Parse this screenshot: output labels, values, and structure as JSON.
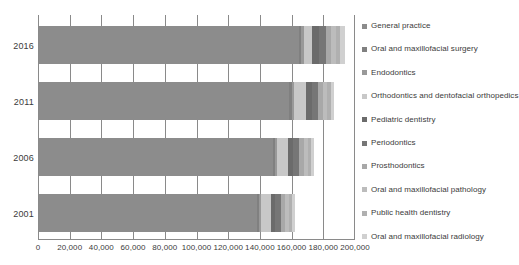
{
  "chart_data": {
    "type": "bar",
    "orientation": "horizontal",
    "stacked": true,
    "title": "",
    "xlabel": "",
    "ylabel": "",
    "xlim": [
      0,
      200000
    ],
    "grid": true,
    "legend_position": "right",
    "categories": [
      "2016",
      "2011",
      "2006",
      "2001"
    ],
    "xticks": [
      0,
      20000,
      40000,
      60000,
      80000,
      100000,
      120000,
      140000,
      160000,
      180000,
      200000
    ],
    "xtick_labels": [
      "0",
      "20,000",
      "40,000",
      "60,000",
      "80,000",
      "100,000",
      "120,000",
      "140,000",
      "160,000",
      "180,000",
      "200,000"
    ],
    "series": [
      {
        "name": "General practice",
        "color": "#8c8c8c",
        "values": [
          164000,
          158000,
          147500,
          137500
        ]
      },
      {
        "name": "Oral and maxillofacial surgery",
        "color": "#808080",
        "values": [
          1500,
          1400,
          1300,
          1200
        ]
      },
      {
        "name": "Endodontics",
        "color": "#999999",
        "values": [
          1700,
          1600,
          1500,
          1300
        ]
      },
      {
        "name": "Orthodontics and dentofacial orthopedics",
        "color": "#c8c8c8",
        "values": [
          5000,
          7500,
          7000,
          6500
        ]
      },
      {
        "name": "Pediatric dentistry",
        "color": "#6b6b6b",
        "values": [
          4500,
          3500,
          3000,
          2600
        ]
      },
      {
        "name": "Periodontics",
        "color": "#767676",
        "values": [
          4300,
          4000,
          3800,
          3500
        ]
      },
      {
        "name": "Prosthodontics",
        "color": "#a8a8a8",
        "values": [
          3200,
          3000,
          2900,
          2800
        ]
      },
      {
        "name": "Oral and maxillofacial pathology",
        "color": "#bcbcbc",
        "values": [
          3000,
          2800,
          2600,
          2400
        ]
      },
      {
        "name": "Public health dentistry",
        "color": "#b0b0b0",
        "values": [
          2800,
          2200,
          2000,
          1900
        ]
      },
      {
        "name": "Oral and maxillofacial radiology",
        "color": "#d0d0d0",
        "values": [
          3000,
          2000,
          1900,
          1800
        ]
      }
    ],
    "totals": [
      193000,
      184000,
      173500,
      163500
    ]
  },
  "axis": {
    "tick_0": "0",
    "tick_1": "20,000",
    "tick_2": "40,000",
    "tick_3": "60,000",
    "tick_4": "80,000",
    "tick_5": "100,000",
    "tick_6": "120,000",
    "tick_7": "140,000",
    "tick_8": "160,000",
    "tick_9": "180,000",
    "tick_10": "200,000"
  },
  "ycats": {
    "c0": "2016",
    "c1": "2011",
    "c2": "2006",
    "c3": "2001"
  }
}
